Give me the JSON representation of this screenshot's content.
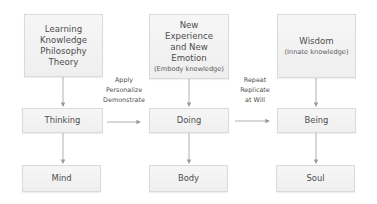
{
  "diagram": {
    "type": "flow",
    "columns": [
      {
        "id": "thinking-column",
        "top": {
          "lines": [
            "Learning",
            "Knowledge",
            "Philosophy",
            "Theory"
          ],
          "sub": ""
        },
        "middle": {
          "label": "Thinking"
        },
        "bottom": {
          "label": "Mind"
        }
      },
      {
        "id": "doing-column",
        "top": {
          "lines": [
            "New",
            "Experience",
            "and New",
            "Emotion"
          ],
          "sub": "(Embody knowledge)"
        },
        "middle": {
          "label": "Doing"
        },
        "bottom": {
          "label": "Body"
        }
      },
      {
        "id": "being-column",
        "top": {
          "lines": [
            "Wisdom"
          ],
          "sub": "(Innate knowledge)"
        },
        "middle": {
          "label": "Being"
        },
        "bottom": {
          "label": "Soul"
        }
      }
    ],
    "transitions": [
      {
        "from": "Thinking",
        "to": "Doing",
        "lines": [
          "Apply",
          "Personalize",
          "Demonstrate"
        ]
      },
      {
        "from": "Doing",
        "to": "Being",
        "lines": [
          "Repeat",
          "Replicate",
          "at Will"
        ]
      }
    ],
    "colors": {
      "box_fill": "#f2f2f2",
      "box_border": "#dadada",
      "text": "#4d4d4d",
      "arrow": "#9a9a9a",
      "background": "#ffffff"
    }
  }
}
